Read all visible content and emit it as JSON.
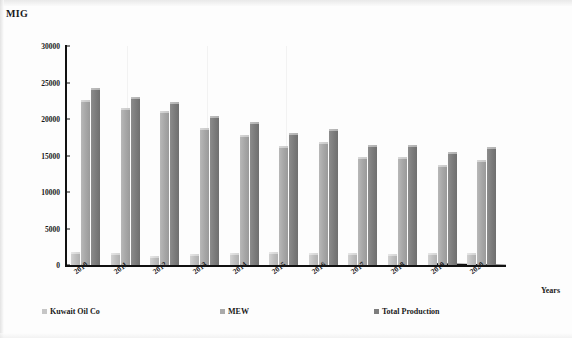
{
  "chart_data": {
    "type": "bar",
    "title": "MIG",
    "xlabel": "Years",
    "ylabel": "MIG",
    "ylim": [
      0,
      30000
    ],
    "yticks": [
      0,
      5000,
      10000,
      15000,
      20000,
      25000,
      30000
    ],
    "ytick_labels": [
      "0",
      "5000",
      "10000",
      "15000",
      "20000",
      "25000",
      "30000"
    ],
    "grid": false,
    "legend_position": "bottom",
    "categories": [
      "2010",
      "2011",
      "2012",
      "2013",
      "2014",
      "2015",
      "2016",
      "2017",
      "2018",
      "2019",
      "2020"
    ],
    "series": [
      {
        "name": "Kuwait Oil Co",
        "color": "#c6c6c6",
        "values": [
          1850,
          1600,
          1250,
          1500,
          1600,
          1750,
          1650,
          1600,
          1500,
          1650,
          1600
        ]
      },
      {
        "name": "MEW",
        "color": "#aaaaaa",
        "values": [
          22600,
          21500,
          21100,
          18800,
          17800,
          16300,
          16800,
          14800,
          14850,
          13650,
          14400
        ]
      },
      {
        "name": "Total Production",
        "color": "#7d7d7d",
        "values": [
          24300,
          23050,
          22300,
          20400,
          19550,
          18100,
          18600,
          16500,
          16500,
          15500,
          16150
        ]
      }
    ]
  },
  "axes": {
    "y_title": "MIG",
    "x_title": "Years"
  }
}
